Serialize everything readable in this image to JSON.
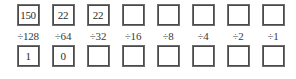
{
  "worksheet": {
    "title": "Binary place-value division worksheet",
    "columns": [
      {
        "top_value": "150",
        "divisor": "÷128",
        "bottom_value": "1"
      },
      {
        "top_value": "22",
        "divisor": "÷64",
        "bottom_value": "0"
      },
      {
        "top_value": "22",
        "divisor": "÷32",
        "bottom_value": ""
      },
      {
        "top_value": "",
        "divisor": "÷16",
        "bottom_value": ""
      },
      {
        "top_value": "",
        "divisor": "÷8",
        "bottom_value": ""
      },
      {
        "top_value": "",
        "divisor": "÷4",
        "bottom_value": ""
      },
      {
        "top_value": "",
        "divisor": "÷2",
        "bottom_value": ""
      },
      {
        "top_value": "",
        "divisor": "÷1",
        "bottom_value": ""
      }
    ],
    "colors": {
      "box_border_outer": "#6e6e6e",
      "box_border_inner": "#4a4a4a",
      "text": "#2b2b2b",
      "divisor_text": "#3a3a3a",
      "background": "#ffffff"
    }
  }
}
